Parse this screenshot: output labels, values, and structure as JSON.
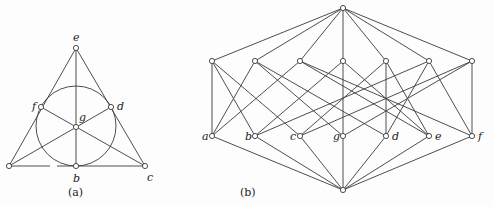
{
  "figure_a": {
    "caption": "(a)",
    "title": "Fano plane",
    "points": [
      {
        "id": "a",
        "label": "",
        "x": 9,
        "y": 166
      },
      {
        "id": "b",
        "label": "b",
        "x": 76,
        "y": 166,
        "lx": 73,
        "ly": 182
      },
      {
        "id": "c",
        "label": "c",
        "x": 145,
        "y": 166,
        "lx": 147,
        "ly": 181
      },
      {
        "id": "d",
        "label": "d",
        "x": 111,
        "y": 107,
        "lx": 117,
        "ly": 110
      },
      {
        "id": "e",
        "label": "e",
        "x": 76,
        "y": 48,
        "lx": 73,
        "ly": 41
      },
      {
        "id": "f",
        "label": "f",
        "x": 41,
        "y": 107,
        "lx": 32,
        "ly": 110
      },
      {
        "id": "g",
        "label": "g",
        "x": 76,
        "y": 127,
        "lx": 79,
        "ly": 121
      }
    ],
    "segments": [
      [
        9,
        166,
        76,
        48
      ],
      [
        76,
        48,
        145,
        166
      ],
      [
        76,
        48,
        76,
        166
      ],
      [
        9,
        166,
        50,
        166
      ],
      [
        57,
        166,
        145,
        166
      ],
      [
        9,
        166,
        111,
        107
      ],
      [
        41,
        107,
        145,
        166
      ]
    ],
    "circle": {
      "cx": 76,
      "cy": 126,
      "r": 40
    }
  },
  "figure_b": {
    "caption": "(b)",
    "title": "Incidence lattice of the Fano plane",
    "top": {
      "x": 343,
      "y": 8
    },
    "bottom": {
      "x": 343,
      "y": 190
    },
    "lines_row_y": 61,
    "points_row_y": 136,
    "lines": [
      {
        "id": "L1",
        "x": 212,
        "points": [
          "a",
          "b",
          "c"
        ]
      },
      {
        "id": "L2",
        "x": 255,
        "points": [
          "a",
          "g",
          "d"
        ]
      },
      {
        "id": "L3",
        "x": 300,
        "points": [
          "a",
          "e",
          "f"
        ]
      },
      {
        "id": "L4",
        "x": 343,
        "points": [
          "b",
          "g",
          "e"
        ]
      },
      {
        "id": "L5",
        "x": 386,
        "points": [
          "c",
          "d",
          "e"
        ]
      },
      {
        "id": "L6",
        "x": 429,
        "points": [
          "b",
          "d",
          "f"
        ]
      },
      {
        "id": "L7",
        "x": 472,
        "points": [
          "c",
          "g",
          "f"
        ]
      }
    ],
    "points": [
      {
        "id": "a",
        "label": "a",
        "x": 212
      },
      {
        "id": "b",
        "label": "b",
        "x": 255
      },
      {
        "id": "c",
        "label": "c",
        "x": 300
      },
      {
        "id": "g",
        "label": "g",
        "x": 343
      },
      {
        "id": "d",
        "label": "d",
        "x": 386
      },
      {
        "id": "e",
        "label": "e",
        "x": 429
      },
      {
        "id": "f",
        "label": "f",
        "x": 472
      }
    ]
  }
}
